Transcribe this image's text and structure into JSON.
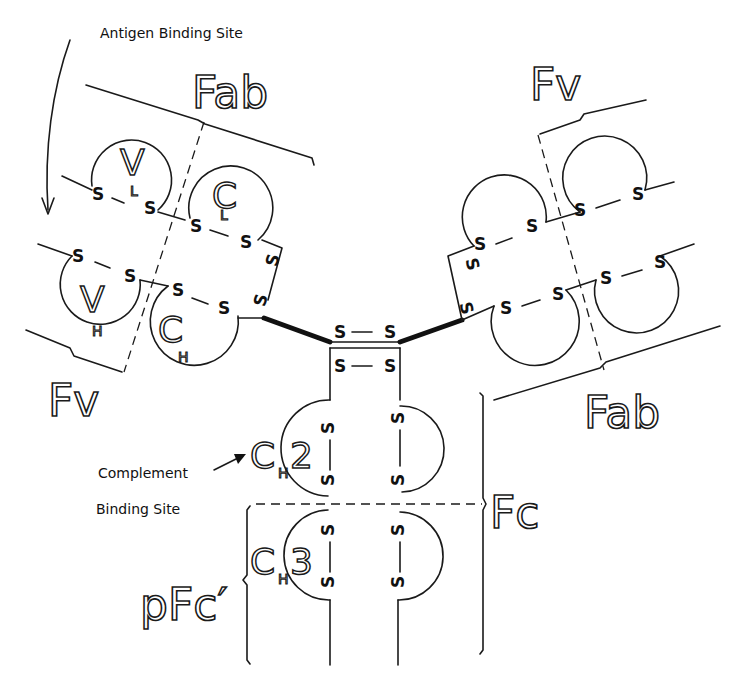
{
  "diagram": {
    "annotations": {
      "antigen_binding_site": "Antigen Binding Site",
      "complement_binding_site_line1": "Complement",
      "complement_binding_site_line2": "Binding Site"
    },
    "fragment_labels": {
      "fab_left": "Fab",
      "fab_right": "Fab",
      "fv_left": "Fv",
      "fv_right": "Fv",
      "fc": "Fc",
      "pfc": "pFc′"
    },
    "domain_labels": {
      "vl": "V",
      "vl_sub": "L",
      "cl": "C",
      "cl_sub": "L",
      "vh": "V",
      "vh_sub": "H",
      "ch1": "C",
      "ch1_sub": "H",
      "ch1_num": "1",
      "ch2": "C",
      "ch2_sub": "H",
      "ch2_num": "2",
      "ch3": "C",
      "ch3_sub": "H",
      "ch3_num": "3"
    },
    "disulfide": "S",
    "disulfide_bond": "S — S"
  }
}
